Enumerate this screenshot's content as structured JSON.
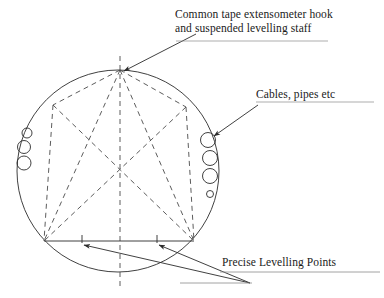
{
  "figure": {
    "type": "engineering-cross-section-diagram"
  },
  "labels": {
    "hook": {
      "line1": "Common tape extensometer hook",
      "line2": "and suspended levelling staff"
    },
    "cables": "Cables, pipes etc",
    "precise_points": "Precise Levelling Points"
  },
  "geometry": {
    "tunnel_circle": {
      "cx": 118,
      "cy": 171,
      "r": 101
    },
    "nodes": {
      "crown": {
        "x": 120,
        "y": 70
      },
      "upper_left": {
        "x": 53,
        "y": 105
      },
      "upper_right": {
        "x": 186,
        "y": 107
      },
      "lower_left": {
        "x": 44,
        "y": 241
      },
      "lower_right": {
        "x": 194,
        "y": 241
      },
      "centre_intersection": {
        "x": 120,
        "y": 170
      }
    },
    "invert_chord": {
      "x1": 44,
      "y1": 241,
      "x2": 194,
      "y2": 241
    },
    "levelling_ticks": [
      {
        "x": 82,
        "y": 241
      },
      {
        "x": 157,
        "y": 241
      }
    ],
    "left_services": [
      {
        "cx": 27,
        "cy": 133,
        "r": 5
      },
      {
        "cx": 24,
        "cy": 147,
        "r": 6.5
      },
      {
        "cx": 24,
        "cy": 163,
        "r": 7
      }
    ],
    "right_services": [
      {
        "cx": 208,
        "cy": 140,
        "r": 7.5
      },
      {
        "cx": 210,
        "cy": 158,
        "r": 7.5
      },
      {
        "cx": 210,
        "cy": 176,
        "r": 7.5
      },
      {
        "cx": 210,
        "cy": 194,
        "r": 3.5
      }
    ]
  },
  "style": {
    "line_color": "#2b2b2b",
    "dashed_color": "#4a4a4a",
    "text_color": "#1a1a1a",
    "background": "#ffffff"
  },
  "icons": {
    "arrowhead": "arrow-head-icon",
    "tick_mark": "tick-mark-icon"
  }
}
